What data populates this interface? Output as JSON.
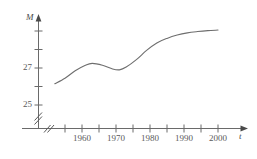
{
  "figure": {
    "kind": "line-graph",
    "background_color": "#ffffff",
    "line_color": "#6e6e6e",
    "axis_color": "#6a6a6a",
    "text_color": "#5a5a5a"
  },
  "chart_data": {
    "type": "line",
    "title": "",
    "xlabel": "t",
    "ylabel": "M",
    "xlim": [
      1951,
      2003
    ],
    "ylim": [
      24.3,
      29.6
    ],
    "grid": false,
    "legend": null,
    "axis_break_x": true,
    "axis_break_y": true,
    "x_tick_labels": [
      "1960",
      "1970",
      "1980",
      "1990",
      "2000"
    ],
    "x_tick_values": [
      1960,
      1970,
      1980,
      1990,
      2000
    ],
    "x_minor_tick_values": [
      1955,
      1965,
      1975,
      1985,
      1995
    ],
    "y_tick_labels": [
      "25",
      "27"
    ],
    "y_tick_values": [
      25,
      27
    ],
    "y_minor_tick_values": [
      26,
      28,
      29
    ],
    "x": [
      1952,
      1955,
      1958,
      1961,
      1963,
      1966,
      1969,
      1971,
      1973,
      1976,
      1979,
      1982,
      1985,
      1988,
      1991,
      1994,
      1997,
      2000
    ],
    "values": [
      26.15,
      26.45,
      26.85,
      27.15,
      27.25,
      27.15,
      26.95,
      26.9,
      27.05,
      27.45,
      27.95,
      28.35,
      28.6,
      28.78,
      28.9,
      28.97,
      29.02,
      29.05
    ],
    "annotations": []
  },
  "labels": {
    "y_axis": "M",
    "x_axis": "t",
    "y_27": "27",
    "y_25": "25",
    "x_1960": "1960",
    "x_1970": "1970",
    "x_1980": "1980",
    "x_1990": "1990",
    "x_2000": "2000"
  }
}
